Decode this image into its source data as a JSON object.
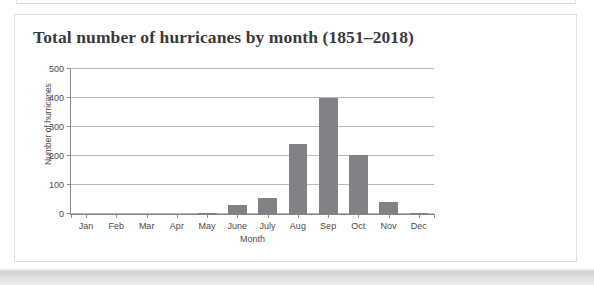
{
  "panel": {
    "title": "Total number of hurricanes by month (1851–2018)"
  },
  "chart_data": {
    "type": "bar",
    "title": "Total number of hurricanes by month (1851–2018)",
    "xlabel": "Month",
    "ylabel": "Number of hurricanes",
    "categories": [
      "Jan",
      "Feb",
      "Mar",
      "Apr",
      "May",
      "June",
      "July",
      "Aug",
      "Sep",
      "Oct",
      "Nov",
      "Dec"
    ],
    "values": [
      1,
      0,
      0,
      1,
      3,
      30,
      54,
      240,
      400,
      205,
      40,
      3
    ],
    "ylim": [
      0,
      500
    ],
    "yticks": [
      0,
      100,
      200,
      300,
      400,
      500
    ],
    "ytick_labels": [
      "0",
      "100",
      "200",
      "300",
      "400",
      "500"
    ],
    "grid": true,
    "legend": "none",
    "bar_color": "#808285",
    "grid_color": "#b6b8ba",
    "axis_color": "#8a8c8e",
    "text_color": "#4a4a4a"
  }
}
